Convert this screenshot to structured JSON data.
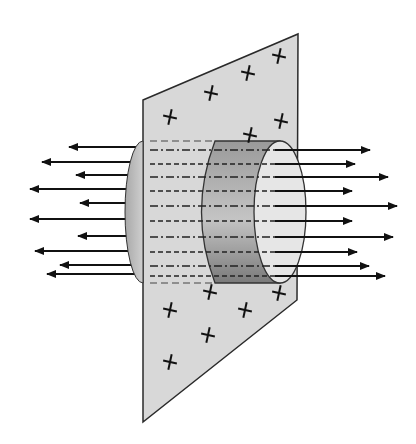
{
  "diagram": {
    "colors": {
      "background": "#ffffff",
      "plane_fill": "#d8d8d8",
      "plane_stroke": "#2a2a2a",
      "cylinder_dark": "#8a8a8a",
      "cylinder_light": "#e6e6e6",
      "arrow": "#111111"
    },
    "plane": {
      "corners": [
        [
          143,
          100
        ],
        [
          298,
          34
        ],
        [
          297,
          300
        ],
        [
          143,
          422
        ]
      ]
    },
    "charges": {
      "symbol": "+",
      "positions": [
        [
          170,
          117
        ],
        [
          211,
          93
        ],
        [
          248,
          73
        ],
        [
          279,
          56
        ],
        [
          281,
          121
        ],
        [
          250,
          135
        ],
        [
          210,
          292
        ],
        [
          170,
          310
        ],
        [
          245,
          310
        ],
        [
          208,
          335
        ],
        [
          170,
          362
        ],
        [
          279,
          293
        ]
      ]
    },
    "cylinder": {
      "top_y": 141,
      "bottom_y": 283,
      "left_cap_x": 125,
      "right_body_left_x": 193,
      "right_ellipse_cx": 280,
      "right_ellipse_rx": 26
    },
    "field_lines_left": [
      {
        "tip_x": 69,
        "y": 147
      },
      {
        "tip_x": 42,
        "y": 162
      },
      {
        "tip_x": 76,
        "y": 175
      },
      {
        "tip_x": 30,
        "y": 189
      },
      {
        "tip_x": 80,
        "y": 203
      },
      {
        "tip_x": 30,
        "y": 219
      },
      {
        "tip_x": 78,
        "y": 236
      },
      {
        "tip_x": 35,
        "y": 251
      },
      {
        "tip_x": 60,
        "y": 265
      },
      {
        "tip_x": 47,
        "y": 274
      }
    ],
    "field_lines_right": [
      {
        "tip_x": 370,
        "y": 150
      },
      {
        "tip_x": 355,
        "y": 164
      },
      {
        "tip_x": 388,
        "y": 177
      },
      {
        "tip_x": 352,
        "y": 191
      },
      {
        "tip_x": 397,
        "y": 206
      },
      {
        "tip_x": 352,
        "y": 221
      },
      {
        "tip_x": 393,
        "y": 237
      },
      {
        "tip_x": 357,
        "y": 252
      },
      {
        "tip_x": 369,
        "y": 266
      },
      {
        "tip_x": 385,
        "y": 276
      }
    ]
  }
}
